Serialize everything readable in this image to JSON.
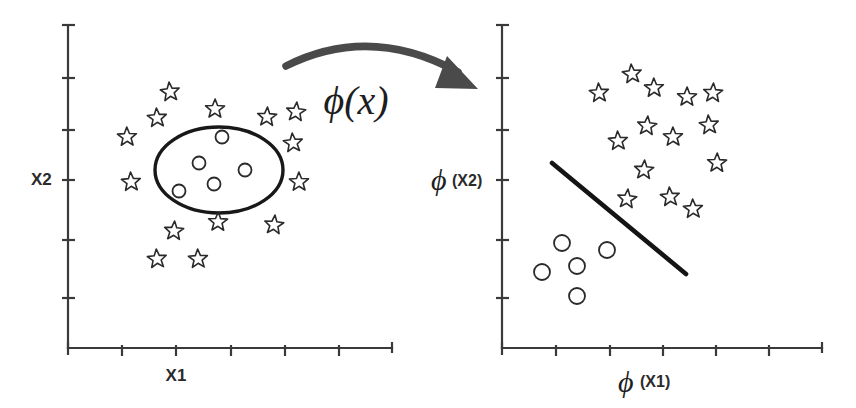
{
  "figure": {
    "background_color": "#ffffff",
    "ink_color": "#2a2a2a"
  },
  "transform": {
    "label": "ϕ(x)",
    "arrow_name": "curved-mapping-arrow",
    "label_x": 356,
    "label_y": 112
  },
  "left_plot": {
    "name": "input-space-plot",
    "x_axis_label": "X1",
    "y_axis_label": "X2",
    "x_axis_label_pos": [
      176,
      381
    ],
    "y_axis_label_pos": [
      31,
      185
    ],
    "axis": {
      "origin": [
        68,
        348
      ],
      "x_end": 392,
      "y_top": 25,
      "x_ticks": [
        68,
        122,
        176,
        231,
        285,
        339,
        392
      ],
      "y_ticks": [
        25,
        78,
        130,
        180,
        240,
        298,
        348
      ]
    },
    "boundary": {
      "type": "ellipse",
      "cx": 219,
      "cy": 170,
      "rx": 64,
      "ry": 43
    },
    "circles": [
      {
        "cx": 222,
        "cy": 137,
        "r": 6.5
      },
      {
        "cx": 199,
        "cy": 163,
        "r": 6.5
      },
      {
        "cx": 245,
        "cy": 170,
        "r": 6.5
      },
      {
        "cx": 214,
        "cy": 184,
        "r": 6.5
      },
      {
        "cx": 179,
        "cy": 191,
        "r": 6.5
      }
    ],
    "stars": [
      {
        "cx": 170,
        "cy": 92,
        "r": 10
      },
      {
        "cx": 157,
        "cy": 118,
        "r": 10
      },
      {
        "cx": 127,
        "cy": 137,
        "r": 10
      },
      {
        "cx": 215,
        "cy": 109,
        "r": 10
      },
      {
        "cx": 267,
        "cy": 117,
        "r": 10
      },
      {
        "cx": 296,
        "cy": 112,
        "r": 10
      },
      {
        "cx": 293,
        "cy": 143,
        "r": 10
      },
      {
        "cx": 131,
        "cy": 182,
        "r": 10
      },
      {
        "cx": 299,
        "cy": 182,
        "r": 10
      },
      {
        "cx": 218,
        "cy": 222,
        "r": 10
      },
      {
        "cx": 174,
        "cy": 231,
        "r": 10
      },
      {
        "cx": 274,
        "cy": 225,
        "r": 10
      },
      {
        "cx": 157,
        "cy": 259,
        "r": 10
      },
      {
        "cx": 198,
        "cy": 259,
        "r": 10
      }
    ],
    "counts": {
      "stars": 14,
      "circles": 5
    }
  },
  "right_plot": {
    "name": "feature-space-plot",
    "x_axis_label": "ϕ (X1)",
    "y_axis_label": "ϕ (X2)",
    "x_axis_phi": "ϕ",
    "x_axis_sub": "(X1)",
    "y_axis_phi": "ϕ",
    "y_axis_sub": "(X2)",
    "axis": {
      "origin": [
        502,
        348
      ],
      "x_end": 822,
      "y_top": 25,
      "x_ticks": [
        502,
        556,
        610,
        663,
        716,
        769,
        822
      ],
      "y_ticks": [
        25,
        78,
        130,
        180,
        240,
        298,
        348
      ]
    },
    "separator": {
      "type": "line",
      "x1": 552,
      "y1": 163,
      "x2": 686,
      "y2": 274
    },
    "circles": [
      {
        "cx": 562,
        "cy": 243,
        "r": 8
      },
      {
        "cx": 607,
        "cy": 250,
        "r": 8
      },
      {
        "cx": 577,
        "cy": 266,
        "r": 8
      },
      {
        "cx": 542,
        "cy": 272,
        "r": 8
      },
      {
        "cx": 577,
        "cy": 296,
        "r": 8
      }
    ],
    "stars": [
      {
        "cx": 632,
        "cy": 74,
        "r": 10
      },
      {
        "cx": 599,
        "cy": 93,
        "r": 10
      },
      {
        "cx": 654,
        "cy": 88,
        "r": 10
      },
      {
        "cx": 687,
        "cy": 97,
        "r": 10
      },
      {
        "cx": 713,
        "cy": 93,
        "r": 10
      },
      {
        "cx": 647,
        "cy": 126,
        "r": 10
      },
      {
        "cx": 709,
        "cy": 125,
        "r": 10
      },
      {
        "cx": 618,
        "cy": 141,
        "r": 10
      },
      {
        "cx": 673,
        "cy": 137,
        "r": 10
      },
      {
        "cx": 717,
        "cy": 163,
        "r": 10
      },
      {
        "cx": 644,
        "cy": 170,
        "r": 10
      },
      {
        "cx": 627,
        "cy": 199,
        "r": 10
      },
      {
        "cx": 670,
        "cy": 197,
        "r": 10
      },
      {
        "cx": 693,
        "cy": 209,
        "r": 10
      }
    ],
    "counts": {
      "stars": 14,
      "circles": 5
    }
  },
  "chart_data": {
    "type": "scatter",
    "panels": [
      {
        "name": "input-space",
        "xlabel": "X1",
        "ylabel": "X2",
        "grid": false,
        "legend": null,
        "annotation": "circular decision boundary (ellipse) encloses the circle class",
        "series": [
          {
            "name": "stars",
            "marker": "star",
            "n": 14,
            "points": [
              [
                170,
                92
              ],
              [
                157,
                118
              ],
              [
                127,
                137
              ],
              [
                215,
                109
              ],
              [
                267,
                117
              ],
              [
                296,
                112
              ],
              [
                293,
                143
              ],
              [
                131,
                182
              ],
              [
                299,
                182
              ],
              [
                218,
                222
              ],
              [
                174,
                231
              ],
              [
                274,
                225
              ],
              [
                157,
                259
              ],
              [
                198,
                259
              ]
            ]
          },
          {
            "name": "circles",
            "marker": "circle",
            "n": 5,
            "points": [
              [
                222,
                137
              ],
              [
                199,
                163
              ],
              [
                245,
                170
              ],
              [
                214,
                184
              ],
              [
                179,
                191
              ]
            ]
          }
        ]
      },
      {
        "name": "feature-space",
        "xlabel": "ϕ (X1)",
        "ylabel": "ϕ (X2)",
        "grid": false,
        "legend": null,
        "annotation": "straight-line decision boundary separates the two classes",
        "series": [
          {
            "name": "stars",
            "marker": "star",
            "n": 14,
            "points": [
              [
                632,
                74
              ],
              [
                599,
                93
              ],
              [
                654,
                88
              ],
              [
                687,
                97
              ],
              [
                713,
                93
              ],
              [
                647,
                126
              ],
              [
                709,
                125
              ],
              [
                618,
                141
              ],
              [
                673,
                137
              ],
              [
                717,
                163
              ],
              [
                644,
                170
              ],
              [
                627,
                199
              ],
              [
                670,
                197
              ],
              [
                693,
                209
              ]
            ]
          },
          {
            "name": "circles",
            "marker": "circle",
            "n": 5,
            "points": [
              [
                562,
                243
              ],
              [
                607,
                250
              ],
              [
                577,
                266
              ],
              [
                542,
                272
              ],
              [
                577,
                296
              ]
            ]
          }
        ]
      }
    ]
  }
}
